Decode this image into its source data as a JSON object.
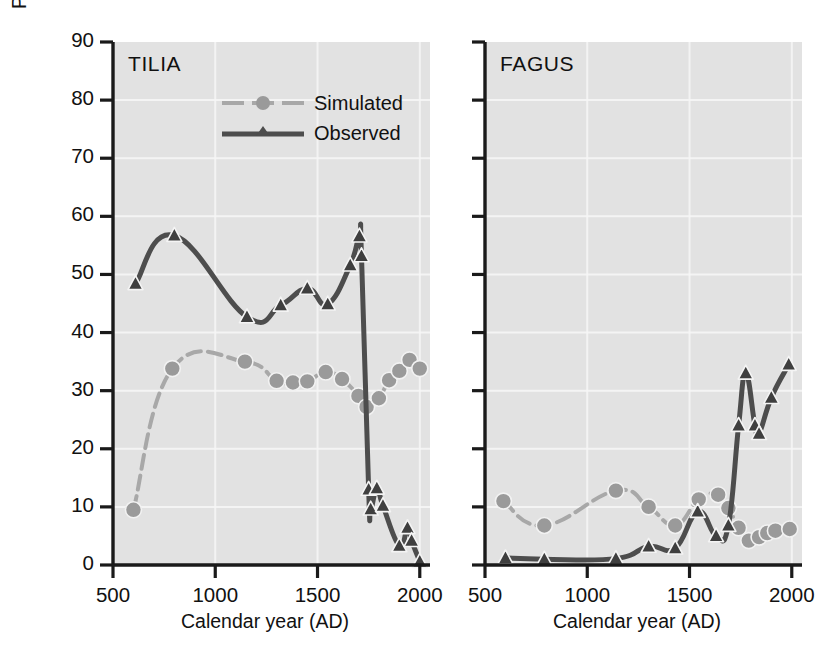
{
  "figure": {
    "background": "#ffffff",
    "panel_background": "#e2e2e2",
    "axis_color": "#1a1a1a",
    "grid_color": "#f7f7f7",
    "observed_color": "#4d4d4d",
    "simulated_color": "#a8a8a8"
  },
  "axes": {
    "y_label": "Percent (forest biomass / tree pollen)",
    "y_ticks": [
      "0",
      "10",
      "20",
      "30",
      "40",
      "50",
      "60",
      "70",
      "80",
      "90"
    ],
    "y_min": 0,
    "y_max": 90,
    "x_label": "Calendar year (AD)",
    "x_ticks": [
      "500",
      "1000",
      "1500",
      "2000"
    ],
    "x_min": 500,
    "x_max": 2050
  },
  "legend": {
    "position": "top-center-left-panel",
    "entries": [
      {
        "label": "Simulated",
        "marker": "circle",
        "style": "dashed",
        "color": "#a8a8a8"
      },
      {
        "label": "Observed",
        "marker": "triangle",
        "style": "solid",
        "color": "#4d4d4d"
      }
    ]
  },
  "panels": [
    {
      "id": "tilia",
      "title": "TILIA"
    },
    {
      "id": "fagus",
      "title": "FAGUS"
    }
  ],
  "chart_data": [
    {
      "type": "line",
      "title": "TILIA",
      "xlabel": "Calendar year (AD)",
      "ylabel": "Percent (forest biomass / tree pollen)",
      "xlim": [
        500,
        2050
      ],
      "ylim": [
        0,
        90
      ],
      "grid": true,
      "legend_position": "upper-center",
      "series": [
        {
          "name": "Simulated",
          "marker": "circle",
          "color": "#a8a8a8",
          "points": [
            [
              600,
              9.5
            ],
            [
              790,
              33.8
            ],
            [
              1145,
              35.0
            ],
            [
              1300,
              31.7
            ],
            [
              1380,
              31.4
            ],
            [
              1450,
              31.6
            ],
            [
              1540,
              33.2
            ],
            [
              1620,
              32.0
            ],
            [
              1700,
              29.1
            ],
            [
              1740,
              27.2
            ],
            [
              1800,
              28.7
            ],
            [
              1850,
              31.8
            ],
            [
              1900,
              33.4
            ],
            [
              1950,
              35.3
            ],
            [
              2000,
              33.8
            ]
          ]
        },
        {
          "name": "Observed",
          "marker": "triangle",
          "color": "#4d4d4d",
          "points": [
            [
              610,
              48.4
            ],
            [
              800,
              56.7
            ],
            [
              1155,
              42.7
            ],
            [
              1320,
              44.7
            ],
            [
              1450,
              47.6
            ],
            [
              1550,
              44.9
            ],
            [
              1660,
              51.6
            ],
            [
              1705,
              56.6
            ],
            [
              1715,
              53.2
            ],
            [
              1750,
              13.0
            ],
            [
              1760,
              9.6
            ],
            [
              1790,
              13.2
            ],
            [
              1820,
              10.2
            ],
            [
              1900,
              3.3
            ],
            [
              1940,
              6.4
            ],
            [
              1960,
              4.2
            ],
            [
              2000,
              0.6
            ]
          ]
        }
      ]
    },
    {
      "type": "line",
      "title": "FAGUS",
      "xlabel": "Calendar year (AD)",
      "ylabel": "Percent (forest biomass / tree pollen)",
      "xlim": [
        500,
        2050
      ],
      "ylim": [
        0,
        90
      ],
      "grid": true,
      "legend_position": "none",
      "series": [
        {
          "name": "Simulated",
          "marker": "circle",
          "color": "#a8a8a8",
          "points": [
            [
              590,
              11.0
            ],
            [
              790,
              6.8
            ],
            [
              1140,
              12.8
            ],
            [
              1300,
              10.0
            ],
            [
              1430,
              6.8
            ],
            [
              1545,
              11.3
            ],
            [
              1640,
              12.1
            ],
            [
              1690,
              9.8
            ],
            [
              1740,
              6.4
            ],
            [
              1790,
              4.2
            ],
            [
              1840,
              4.8
            ],
            [
              1880,
              5.5
            ],
            [
              1920,
              5.9
            ],
            [
              1990,
              6.2
            ]
          ]
        },
        {
          "name": "Observed",
          "marker": "triangle",
          "color": "#4d4d4d",
          "points": [
            [
              600,
              1.2
            ],
            [
              790,
              1.0
            ],
            [
              1140,
              1.1
            ],
            [
              1300,
              3.2
            ],
            [
              1430,
              2.9
            ],
            [
              1540,
              9.2
            ],
            [
              1630,
              5.0
            ],
            [
              1690,
              6.8
            ],
            [
              1740,
              24.0
            ],
            [
              1775,
              33.0
            ],
            [
              1820,
              24.0
            ],
            [
              1840,
              22.6
            ],
            [
              1900,
              28.8
            ],
            [
              1985,
              34.5
            ]
          ]
        }
      ]
    }
  ]
}
